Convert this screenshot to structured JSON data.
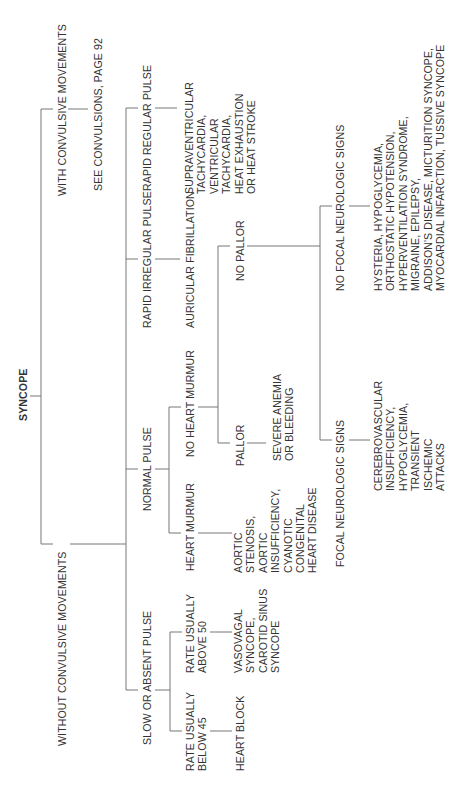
{
  "title": "SYNCOPE",
  "branches": {
    "with_convulsive": {
      "label": "WITH CONVULSIVE MOVEMENTS",
      "result": "SEE CONVULSIONS, PAGE 92"
    },
    "without_convulsive": {
      "label": "WITHOUT CONVULSIVE MOVEMENTS",
      "rapid_regular": {
        "label": "RAPID REGULAR PULSE",
        "result": "SUPRAVENTRICULAR\nTACHYCARDIA,\nVENTRICULAR\nTACHYCARDIA,\nHEAT EXHAUSTION\nOR HEAT STROKE"
      },
      "rapid_irregular": {
        "label": "RAPID IRREGULAR PULSE",
        "result": "AURICULAR FIBRILLATION"
      },
      "normal_pulse": {
        "label": "NORMAL PULSE",
        "no_heart_murmur": {
          "label": "NO HEART MURMUR",
          "no_pallor": {
            "label": "NO PALLOR",
            "no_focal": {
              "label": "NO FOCAL NEUROLOGIC SIGNS",
              "result": "HYSTERIA, HYPOGLYCEMIA,\nORTHOSTATIC HYPOTENSION,\nHYPERVENTILATION SYNDROME,\nMIGRAINE, EPILEPSY,\nADDISON'S DISEASE, MICTURITION SYNCOPE,\nMYOCARDIAL INFARCTION, TUSSIVE SYNCOPE"
            },
            "focal": {
              "label": "FOCAL NEUROLOGIC SIGNS",
              "result": "CEREBROVASCULAR\nINSUFFICIENCY,\nHYPOGLYCEMIA,\nTRANSIENT\nISCHEMIC\nATTACKS"
            }
          },
          "pallor": {
            "label": "PALLOR",
            "result": "SEVERE ANEMIA\nOR BLEEDING"
          }
        },
        "heart_murmur": {
          "label": "HEART MURMUR",
          "result": "AORTIC\nSTENOSIS,\nAORTIC\nINSUFFICIENCY,\nCYANOTIC\nCONGENITAL\nHEART DISEASE"
        }
      },
      "slow_absent": {
        "label": "SLOW OR ABSENT PULSE",
        "above_50": {
          "label": "RATE USUALLY\nABOVE 50",
          "result": "VASOVAGAL\nSYNCOPE,\nCAROTID SINUS\nSYNCOPE"
        },
        "below_45": {
          "label": "RATE USUALLY\nBELOW 45",
          "result": "HEART BLOCK"
        }
      }
    }
  },
  "colors": {
    "line": "#777777",
    "text": "#333333",
    "background": "#ffffff"
  }
}
